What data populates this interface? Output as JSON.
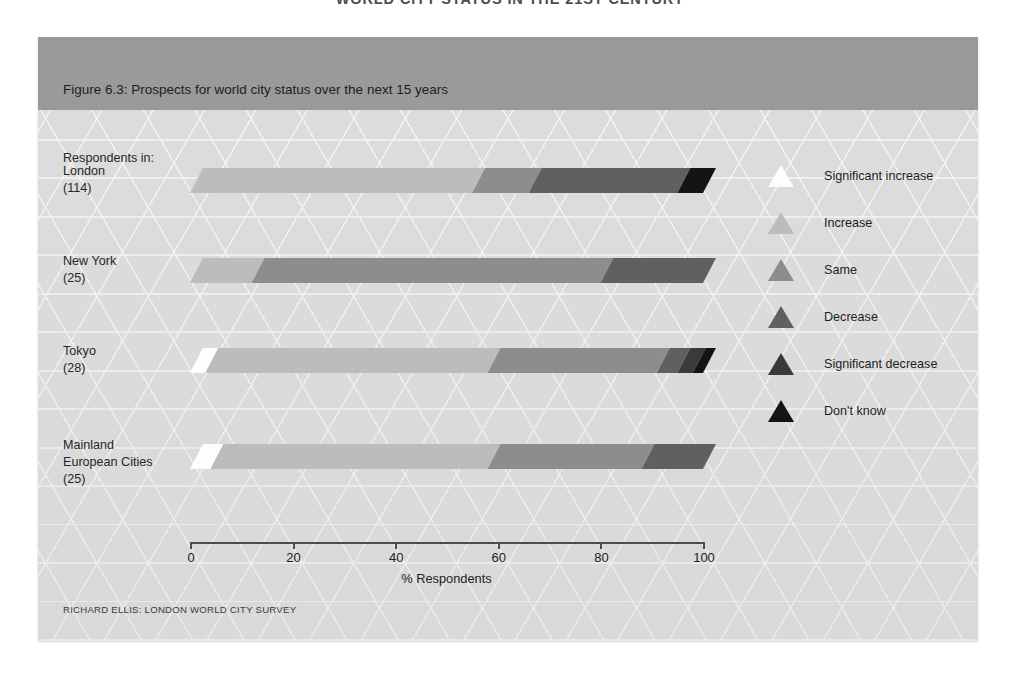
{
  "page": {
    "top_headline": "WORLD CITY STATUS IN THE 21ST CENTURY",
    "caption": "Figure 6.3: Prospects for world city status over the next 15 years",
    "group_header": "Respondents in:",
    "source": "RICHARD ELLIS: LONDON WORLD CITY SURVEY"
  },
  "colors": {
    "panel_background": "#dcdcdc",
    "caption_band": "#9a9a9a",
    "axis": "#4d4d4d",
    "significant_increase": "#fdfdfd",
    "increase": "#bcbcbc",
    "same": "#8d8d8d",
    "decrease": "#606060",
    "significant_decrease": "#3a3a3a",
    "dont_know": "#141414"
  },
  "legend": {
    "position": "right",
    "items": [
      {
        "label": "Significant increase",
        "color": "#fdfdfd"
      },
      {
        "label": "Increase",
        "color": "#bcbcbc"
      },
      {
        "label": "Same",
        "color": "#8d8d8d"
      },
      {
        "label": "Decrease",
        "color": "#606060"
      },
      {
        "label": "Significant decrease",
        "color": "#3a3a3a"
      },
      {
        "label": "Don't know",
        "color": "#141414"
      }
    ]
  },
  "chart_data": {
    "type": "bar",
    "orientation": "horizontal",
    "stacked": true,
    "title": "Figure 6.3: Prospects for world city status over the next 15 years",
    "xlabel": "% Respondents",
    "ylabel": "",
    "xlim": [
      0,
      100
    ],
    "xticks": [
      0,
      20,
      40,
      60,
      80,
      100
    ],
    "grid": false,
    "categories": [
      {
        "name": "London",
        "n": "(114)"
      },
      {
        "name": "New York",
        "n": "(25)"
      },
      {
        "name": "Tokyo",
        "n": "(28)"
      },
      {
        "name": "Mainland European Cities",
        "n": "(25)"
      }
    ],
    "series": [
      {
        "name": "Significant increase",
        "color": "#fdfdfd",
        "values": [
          0,
          0,
          3,
          4
        ]
      },
      {
        "name": "Increase",
        "color": "#bcbcbc",
        "values": [
          55,
          12,
          55,
          54
        ]
      },
      {
        "name": "Same",
        "color": "#8d8d8d",
        "values": [
          11,
          68,
          33,
          30
        ]
      },
      {
        "name": "Decrease",
        "color": "#606060",
        "values": [
          29,
          20,
          4,
          12
        ]
      },
      {
        "name": "Significant decrease",
        "color": "#3a3a3a",
        "values": [
          0,
          0,
          3,
          0
        ]
      },
      {
        "name": "Don't know",
        "color": "#141414",
        "values": [
          5,
          0,
          2,
          0
        ]
      }
    ]
  }
}
